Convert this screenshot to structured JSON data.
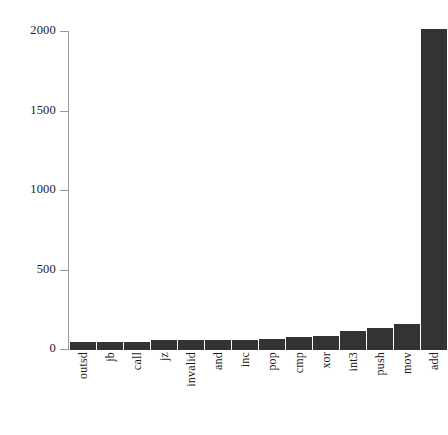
{
  "chart_data": {
    "type": "bar",
    "title": "",
    "xlabel": "",
    "ylabel": "",
    "ylim": [
      0,
      2100
    ],
    "grid": false,
    "legend": null,
    "bar_color": "#333333",
    "axis_color": "#9a9a9a",
    "categories": [
      "outsd",
      "jb",
      "call",
      "jz",
      "invalid",
      "and",
      "inc",
      "pop",
      "cmp",
      "xor",
      "int3",
      "push",
      "mov",
      "add"
    ],
    "values": [
      50,
      50,
      50,
      60,
      60,
      62,
      62,
      70,
      80,
      90,
      120,
      140,
      165,
      2020
    ],
    "ytick_labels": [
      "2000",
      "1500",
      "1000",
      "500",
      "0"
    ],
    "ytick_values": [
      2000,
      1500,
      1000,
      500,
      0
    ]
  }
}
